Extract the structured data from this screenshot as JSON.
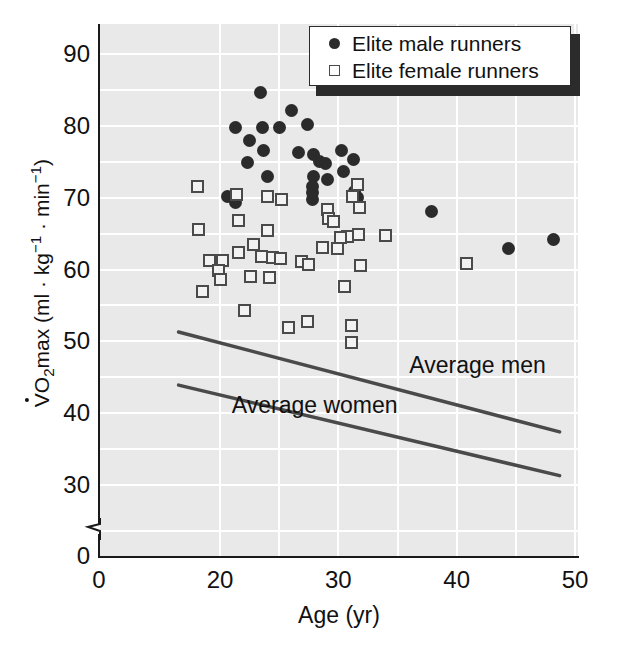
{
  "chart_data": {
    "type": "scatter",
    "title": "",
    "xlabel": "Age (yr)",
    "ylabel": "VO2max (ml · kg-1 · min-1)",
    "ylabel_parts": {
      "v_dot": "V",
      "o": "O",
      "sub2": "2",
      "max": "max (ml · kg",
      "sup_neg1_a": "−1",
      "mid": " · min",
      "sup_neg1_b": "−1",
      "close": ")"
    },
    "xlim": [
      0,
      52
    ],
    "ylim": [
      0,
      95
    ],
    "y_axis_break": true,
    "y_break_between": [
      0,
      25
    ],
    "grid": true,
    "grid_color": "#ffffff",
    "plot_background": "#e9e9e9",
    "xticks": [
      0,
      20,
      30,
      40,
      50
    ],
    "yticks": [
      0,
      30,
      40,
      50,
      60,
      70,
      80,
      90
    ],
    "x_gridlines": [
      20,
      25,
      30,
      35,
      40,
      45,
      50
    ],
    "y_gridlines": [
      30,
      35,
      40,
      45,
      50,
      55,
      60,
      65,
      70,
      75,
      80,
      85,
      90
    ],
    "legend": {
      "position": "top-right",
      "entries": [
        {
          "label": "Elite male runners",
          "marker": "filled-circle",
          "color": "#2b2b2b"
        },
        {
          "label": "Elite female runners",
          "marker": "open-square",
          "color": "#4a4a4a"
        }
      ]
    },
    "annotations": [
      {
        "text": "Average men",
        "x": 36.0,
        "y": 46.5
      },
      {
        "text": "Average women",
        "x": 21.0,
        "y": 41.0
      }
    ],
    "reference_lines": [
      {
        "name": "Average men",
        "x": [
          16.5,
          48.7
        ],
        "y": [
          51.3,
          37.4
        ],
        "color": "#4a4a4a"
      },
      {
        "name": "Average women",
        "x": [
          16.5,
          48.7
        ],
        "y": [
          43.9,
          31.3
        ],
        "color": "#4a4a4a"
      }
    ],
    "series": [
      {
        "name": "Elite male runners",
        "marker": "filled-circle",
        "color": "#2b2b2b",
        "points": [
          [
            23.4,
            84.6
          ],
          [
            26.0,
            82.1
          ],
          [
            21.3,
            79.8
          ],
          [
            23.6,
            79.8
          ],
          [
            25.0,
            79.7
          ],
          [
            27.4,
            80.2
          ],
          [
            22.5,
            78.0
          ],
          [
            23.7,
            76.6
          ],
          [
            26.6,
            76.3
          ],
          [
            30.3,
            76.5
          ],
          [
            27.9,
            76.0
          ],
          [
            22.3,
            74.9
          ],
          [
            28.4,
            75.1
          ],
          [
            28.9,
            74.8
          ],
          [
            31.3,
            75.3
          ],
          [
            24.0,
            73.0
          ],
          [
            30.4,
            73.6
          ],
          [
            27.9,
            73.0
          ],
          [
            29.1,
            72.5
          ],
          [
            27.8,
            71.6
          ],
          [
            27.8,
            70.7
          ],
          [
            27.8,
            69.8
          ],
          [
            20.6,
            70.1
          ],
          [
            21.3,
            69.3
          ],
          [
            31.4,
            70.8
          ],
          [
            31.6,
            70.0
          ],
          [
            37.9,
            68.1
          ],
          [
            44.4,
            62.9
          ],
          [
            48.2,
            64.2
          ]
        ]
      },
      {
        "name": "Elite female runners",
        "marker": "open-square",
        "color": "#4a4a4a",
        "points": [
          [
            18.1,
            71.5
          ],
          [
            21.4,
            70.5
          ],
          [
            24.0,
            70.1
          ],
          [
            25.2,
            69.7
          ],
          [
            31.6,
            71.9
          ],
          [
            31.2,
            70.2
          ],
          [
            31.8,
            68.7
          ],
          [
            29.1,
            68.3
          ],
          [
            29.2,
            67.1
          ],
          [
            29.6,
            66.7
          ],
          [
            21.6,
            66.8
          ],
          [
            18.2,
            65.6
          ],
          [
            24.0,
            65.4
          ],
          [
            31.7,
            64.9
          ],
          [
            30.8,
            64.6
          ],
          [
            30.2,
            64.4
          ],
          [
            34.0,
            64.8
          ],
          [
            22.8,
            63.5
          ],
          [
            28.7,
            63.1
          ],
          [
            29.9,
            62.9
          ],
          [
            21.6,
            62.3
          ],
          [
            23.5,
            61.8
          ],
          [
            24.4,
            61.7
          ],
          [
            25.1,
            61.5
          ],
          [
            19.1,
            61.2
          ],
          [
            20.2,
            61.3
          ],
          [
            26.9,
            61.1
          ],
          [
            27.5,
            60.7
          ],
          [
            31.9,
            60.5
          ],
          [
            40.8,
            60.9
          ],
          [
            19.9,
            59.8
          ],
          [
            20.0,
            58.6
          ],
          [
            22.6,
            59.0
          ],
          [
            24.2,
            58.9
          ],
          [
            30.5,
            57.6
          ],
          [
            18.5,
            57.0
          ],
          [
            22.1,
            54.3
          ],
          [
            25.8,
            51.9
          ],
          [
            27.4,
            52.8
          ],
          [
            31.1,
            52.2
          ],
          [
            31.1,
            49.9
          ]
        ]
      }
    ]
  }
}
